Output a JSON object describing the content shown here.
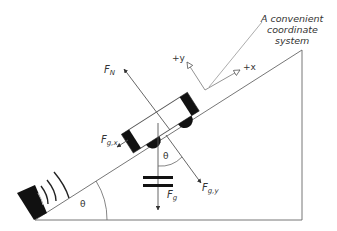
{
  "diagram": {
    "title_annotation": {
      "line1": "A convenient",
      "line2": "coordinate",
      "line3": "system"
    },
    "axes": {
      "plus_x": "+x",
      "plus_y": "+y"
    },
    "forces": {
      "normal": {
        "main": "F",
        "sub": "N"
      },
      "gravity": {
        "main": "F",
        "sub": "g"
      },
      "gravity_x": {
        "main": "F",
        "sub": "g,x"
      },
      "gravity_y": {
        "main": "F",
        "sub": "g,y"
      }
    },
    "angles": {
      "incline_angle": "θ",
      "force_angle": "θ"
    },
    "colors": {
      "line": "#555555",
      "fill_dark": "#111111",
      "background": "#ffffff"
    }
  }
}
